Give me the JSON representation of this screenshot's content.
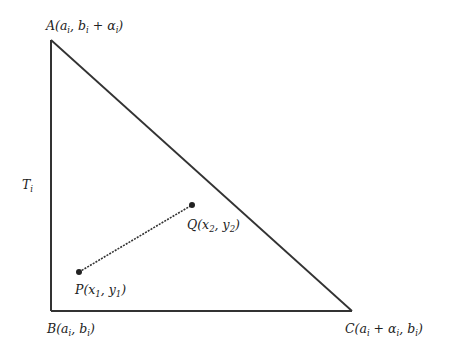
{
  "diagram": {
    "type": "geometric-figure",
    "triangle": {
      "name": "T_i",
      "vertices": {
        "A": {
          "label": "A(a_i, b_i + α_i)",
          "x": 51,
          "y": 40
        },
        "B": {
          "label": "B(a_i, b_i)",
          "x": 51,
          "y": 311
        },
        "C": {
          "label": "C(a_i + α_i, b_i)",
          "x": 352,
          "y": 311
        }
      },
      "stroke": "#333333"
    },
    "segment": {
      "style": "dashed",
      "P": {
        "label": "P(x_1, y_1)",
        "x": 79,
        "y": 272
      },
      "Q": {
        "label": "Q(x_2, y_2)",
        "x": 192,
        "y": 205
      }
    },
    "labels": {
      "A_main": "A",
      "A_rest_open": "(",
      "T_main": "T",
      "T_sub": "i"
    }
  }
}
